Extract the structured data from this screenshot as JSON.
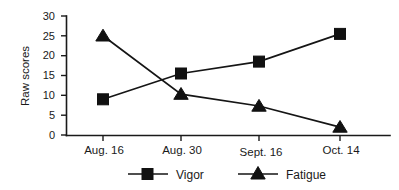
{
  "chart_data": {
    "type": "line",
    "title": "",
    "subtitle": "",
    "xlabel": "",
    "ylabel": "Raw scores",
    "categories": [
      "Aug. 16",
      "Aug. 30",
      "Sept. 16",
      "Oct. 14"
    ],
    "series": [
      {
        "name": "Vigor",
        "marker": "square",
        "color": "#111111",
        "values": [
          9,
          15.5,
          18.5,
          25.5
        ]
      },
      {
        "name": "Fatigue",
        "marker": "triangle",
        "color": "#111111",
        "values": [
          25,
          10.3,
          7.3,
          2
        ]
      }
    ],
    "ylim": [
      0,
      30
    ],
    "yticks": [
      0,
      5,
      10,
      15,
      20,
      25,
      30
    ],
    "ytick_labels": [
      "0",
      "5",
      "10",
      "15",
      "20",
      "25",
      "30"
    ],
    "grid": false,
    "legend_position": "bottom-center",
    "legend_entries": [
      "Vigor",
      "Fatigue"
    ],
    "annotations": []
  },
  "axes": {
    "y_axis_title": "Raw scores",
    "x_tick_0": "Aug. 16",
    "x_tick_1": "Aug. 30",
    "x_tick_2": "Sept. 16",
    "x_tick_3": "Oct. 14",
    "y_tick_0": "0",
    "y_tick_1": "5",
    "y_tick_2": "10",
    "y_tick_3": "15",
    "y_tick_4": "20",
    "y_tick_5": "25",
    "y_tick_6": "30"
  },
  "legend": {
    "item_0_label": "Vigor",
    "item_1_label": "Fatigue"
  },
  "colors": {
    "ink": "#111111",
    "background": "#ffffff"
  }
}
